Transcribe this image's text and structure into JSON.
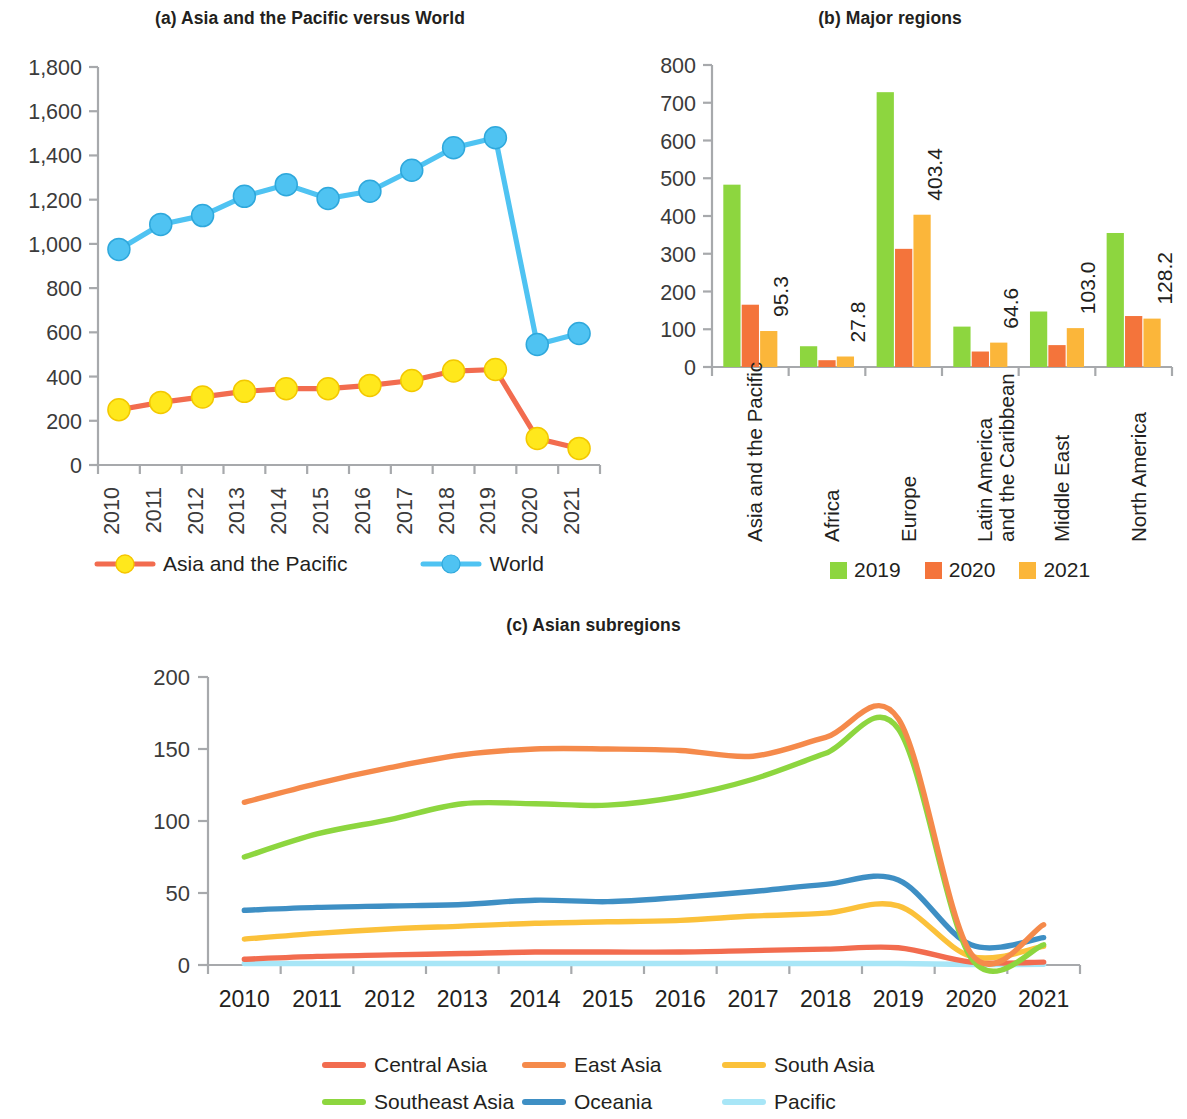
{
  "figure": {
    "panels": [
      {
        "key": "a",
        "title": "(a) Asia and the Pacific versus World"
      },
      {
        "key": "b",
        "title": "(b) Major regions"
      },
      {
        "key": "c",
        "title": "(c) Asian subregions"
      }
    ]
  },
  "panel_a": {
    "title": "(a) Asia and the Pacific versus World",
    "y_ticks": [
      "1,800",
      "1,600",
      "1,400",
      "1,200",
      "1,000",
      "800",
      "600",
      "400",
      "200",
      "0"
    ],
    "x_ticks": [
      "2010",
      "2011",
      "2012",
      "2013",
      "2014",
      "2015",
      "2016",
      "2017",
      "2018",
      "2019",
      "2020",
      "2021"
    ],
    "legend": [
      {
        "label": "Asia and the Pacific",
        "line": "#F26C4F",
        "marker": "#FFE81C"
      },
      {
        "label": "World",
        "line": "#4FC3F2",
        "marker": "#4FC3F2"
      }
    ]
  },
  "panel_b": {
    "title": "(b) Major regions",
    "y_ticks": [
      "800",
      "700",
      "600",
      "500",
      "400",
      "300",
      "200",
      "100",
      "0"
    ],
    "x_ticks": [
      {
        "lines": [
          "Asia and the Pacific"
        ]
      },
      {
        "lines": [
          "Africa"
        ]
      },
      {
        "lines": [
          "Europe"
        ]
      },
      {
        "lines": [
          "Latin America",
          "and the Caribbean"
        ]
      },
      {
        "lines": [
          "Middle East"
        ]
      },
      {
        "lines": [
          "North America"
        ]
      }
    ],
    "legend": [
      {
        "label": "2019",
        "color": "#8DD63F"
      },
      {
        "label": "2020",
        "color": "#F4743B"
      },
      {
        "label": "2021",
        "color": "#FBB63A"
      }
    ],
    "value_labels": [
      "95.3",
      "27.8",
      "403.4",
      "64.6",
      "103.0",
      "128.2"
    ]
  },
  "panel_c": {
    "title": "(c) Asian subregions",
    "y_ticks": [
      "200",
      "150",
      "100",
      "50",
      "0"
    ],
    "x_ticks": [
      "2010",
      "2011",
      "2012",
      "2013",
      "2014",
      "2015",
      "2016",
      "2017",
      "2018",
      "2019",
      "2020",
      "2021"
    ],
    "legend": [
      {
        "label": "Central Asia",
        "color": "#F26C4F"
      },
      {
        "label": "East Asia",
        "color": "#F58A4B"
      },
      {
        "label": "South Asia",
        "color": "#FBC13A"
      },
      {
        "label": "Southeast Asia",
        "color": "#8DD63F"
      },
      {
        "label": "Oceania",
        "color": "#3E8FC4"
      },
      {
        "label": "Pacific",
        "color": "#A8E6F7"
      }
    ]
  },
  "chart_data": [
    {
      "type": "line",
      "panel": "a",
      "title": "(a) Asia and the Pacific versus World",
      "xlabel": "",
      "ylabel": "",
      "x": [
        "2010",
        "2011",
        "2012",
        "2013",
        "2014",
        "2015",
        "2016",
        "2017",
        "2018",
        "2019",
        "2020",
        "2021"
      ],
      "ylim": [
        0,
        1800
      ],
      "yticks": [
        0,
        200,
        400,
        600,
        800,
        1000,
        1200,
        1400,
        1600,
        1800
      ],
      "grid": false,
      "legend_position": "bottom",
      "series": [
        {
          "name": "Asia and the Pacific",
          "color": "#F26C4F",
          "marker_color": "#FFE81C",
          "values": [
            250,
            283,
            308,
            333,
            345,
            345,
            360,
            382,
            425,
            432,
            120,
            75
          ]
        },
        {
          "name": "World",
          "color": "#4FC3F2",
          "marker_color": "#4FC3F2",
          "values": [
            975,
            1088,
            1128,
            1215,
            1268,
            1205,
            1238,
            1333,
            1435,
            1480,
            545,
            595
          ]
        }
      ]
    },
    {
      "type": "bar",
      "panel": "b",
      "title": "(b) Major regions",
      "xlabel": "",
      "ylabel": "",
      "categories": [
        "Asia and the Pacific",
        "Africa",
        "Europe",
        "Latin America and the Caribbean",
        "Middle East",
        "North America"
      ],
      "ylim": [
        0,
        800
      ],
      "yticks": [
        0,
        100,
        200,
        300,
        400,
        500,
        600,
        700,
        800
      ],
      "grid": false,
      "legend_position": "bottom",
      "annotations": [
        "95.3",
        "27.8",
        "403.4",
        "64.6",
        "103.0",
        "128.2"
      ],
      "series": [
        {
          "name": "2019",
          "color": "#8DD63F",
          "values": [
            483,
            55,
            728,
            107,
            147,
            355
          ]
        },
        {
          "name": "2020",
          "color": "#F4743B",
          "values": [
            165,
            18,
            313,
            41,
            58,
            135
          ]
        },
        {
          "name": "2021",
          "color": "#FBB63A",
          "values": [
            95.3,
            27.8,
            403.4,
            64.6,
            103.0,
            128.2
          ]
        }
      ]
    },
    {
      "type": "line",
      "panel": "c",
      "title": "(c) Asian subregions",
      "xlabel": "",
      "ylabel": "",
      "x": [
        "2010",
        "2011",
        "2012",
        "2013",
        "2014",
        "2015",
        "2016",
        "2017",
        "2018",
        "2019",
        "2020",
        "2021"
      ],
      "ylim": [
        0,
        200
      ],
      "yticks": [
        0,
        50,
        100,
        150,
        200
      ],
      "grid": false,
      "legend_position": "bottom",
      "series": [
        {
          "name": "Central Asia",
          "color": "#F26C4F",
          "values": [
            4,
            6,
            7,
            8,
            9,
            9,
            9,
            10,
            11,
            12,
            2,
            2
          ]
        },
        {
          "name": "East Asia",
          "color": "#F58A4B",
          "values": [
            113,
            126,
            137,
            146,
            150,
            150,
            149,
            145,
            158,
            171,
            8,
            28
          ]
        },
        {
          "name": "South Asia",
          "color": "#FBC13A",
          "values": [
            18,
            22,
            25,
            27,
            29,
            30,
            31,
            34,
            36,
            41,
            6,
            13
          ]
        },
        {
          "name": "Southeast Asia",
          "color": "#8DD63F",
          "values": [
            75,
            91,
            101,
            112,
            112,
            111,
            117,
            129,
            147,
            164,
            5,
            14
          ]
        },
        {
          "name": "Oceania",
          "color": "#3E8FC4",
          "values": [
            38,
            40,
            41,
            42,
            45,
            44,
            47,
            51,
            56,
            59,
            14,
            19
          ]
        },
        {
          "name": "Pacific",
          "color": "#A8E6F7",
          "values": [
            1,
            1,
            1,
            1,
            1,
            1,
            1,
            1,
            1,
            1,
            0.3,
            0.5
          ]
        }
      ]
    }
  ]
}
